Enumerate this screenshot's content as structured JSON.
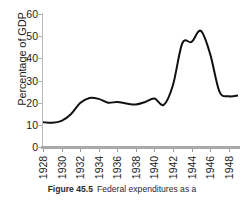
{
  "figure": {
    "caption_label": "Figure 45.5",
    "caption_text": "Federal expenditures as a"
  },
  "chart_data": {
    "type": "line",
    "title": "",
    "subtitle": "",
    "xlabel": "",
    "ylabel": "Percentage of GDP",
    "xlim": [
      1928,
      1949
    ],
    "ylim": [
      0,
      60
    ],
    "grid": false,
    "legend": "none",
    "line_color": "#111111",
    "axis_color": "#a8a8a8",
    "y_ticks": [
      0,
      10,
      20,
      30,
      40,
      50,
      60
    ],
    "y_tick_labels": [
      "0",
      "10",
      "20",
      "30",
      "40",
      "50",
      "60"
    ],
    "x_ticks": [
      1928,
      1930,
      1932,
      1934,
      1936,
      1938,
      1940,
      1942,
      1944,
      1946,
      1948
    ],
    "x_tick_labels": [
      "1928",
      "1930",
      "1932",
      "1934",
      "1936",
      "1938",
      "1940",
      "1942",
      "1944",
      "1946",
      "1948"
    ],
    "x": [
      1928,
      1929,
      1930,
      1931,
      1932,
      1933,
      1934,
      1935,
      1936,
      1937,
      1938,
      1939,
      1940,
      1941,
      1942,
      1943,
      1944,
      1945,
      1946,
      1947,
      1948,
      1949
    ],
    "values": [
      11.2,
      10.9,
      11.8,
      14.8,
      19.8,
      22.1,
      21.7,
      20.0,
      20.3,
      19.6,
      19.2,
      20.3,
      21.9,
      19.0,
      28.0,
      46.8,
      47.4,
      52.4,
      42.0,
      25.0,
      22.9,
      23.2
    ],
    "series": [
      {
        "name": "Federal expenditures as a percentage of GDP",
        "values": [
          11.2,
          10.9,
          11.8,
          14.8,
          19.8,
          22.1,
          21.7,
          20.0,
          20.3,
          19.6,
          19.2,
          20.3,
          21.9,
          19.0,
          28.0,
          46.8,
          47.4,
          52.4,
          42.0,
          25.0,
          22.9,
          23.2
        ]
      }
    ]
  }
}
